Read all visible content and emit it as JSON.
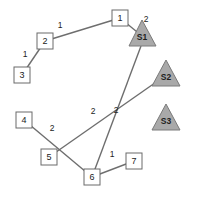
{
  "diagram": {
    "type": "network-graph",
    "colors": {
      "edge": "#6e6e6e",
      "node_fill": "#ffffff",
      "node_stroke": "#6a6a6a",
      "station_fill": "#a9a9a9",
      "station_stroke": "#7a7a7a"
    },
    "nodes": [
      {
        "id": "1",
        "label": "1",
        "shape": "square",
        "x": 120,
        "y": 18
      },
      {
        "id": "2",
        "label": "2",
        "shape": "square",
        "x": 45,
        "y": 41
      },
      {
        "id": "3",
        "label": "3",
        "shape": "square",
        "x": 22,
        "y": 75
      },
      {
        "id": "4",
        "label": "4",
        "shape": "square",
        "x": 24,
        "y": 120
      },
      {
        "id": "5",
        "label": "5",
        "shape": "square",
        "x": 49,
        "y": 157
      },
      {
        "id": "6",
        "label": "6",
        "shape": "square",
        "x": 92,
        "y": 177
      },
      {
        "id": "7",
        "label": "7",
        "shape": "square",
        "x": 134,
        "y": 161
      }
    ],
    "stations": [
      {
        "id": "S1",
        "label": "S1",
        "shape": "triangle",
        "x": 142,
        "y": 34
      },
      {
        "id": "S2",
        "label": "S2",
        "shape": "triangle",
        "x": 166,
        "y": 75
      },
      {
        "id": "S3",
        "label": "S3",
        "shape": "triangle",
        "x": 166,
        "y": 116
      }
    ],
    "edges": [
      {
        "from": "3",
        "to": "2",
        "weight": "1",
        "label_x": 25,
        "label_y": 54
      },
      {
        "from": "2",
        "to": "1",
        "weight": "1",
        "label_x": 60,
        "label_y": 25
      },
      {
        "from": "1",
        "to": "S1",
        "weight": "2",
        "label_x": 146,
        "label_y": 19
      },
      {
        "from": "S1",
        "to": "6",
        "weight": "2",
        "label_x": 116,
        "label_y": 110
      },
      {
        "from": "S2",
        "to": "5",
        "weight": "2",
        "label_x": 93,
        "label_y": 111
      },
      {
        "from": "4",
        "to": "6",
        "weight": "2",
        "label_x": 52,
        "label_y": 128
      },
      {
        "from": "6",
        "to": "7",
        "weight": "1",
        "label_x": 112,
        "label_y": 154
      }
    ]
  }
}
